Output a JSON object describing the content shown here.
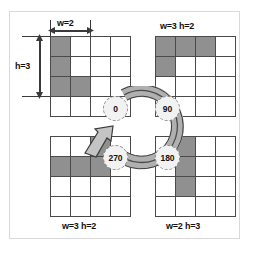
{
  "diagram": {
    "type": "rotation-diagram",
    "grid_size": {
      "rows": 4,
      "cols": 4
    },
    "colors": {
      "shaded_cell": "#909090",
      "empty_cell": "#ffffff",
      "grid_line": "#4a4a4a",
      "ring_fill": "#b0b0b0",
      "ring_stroke": "#3a3a3a",
      "badge_fill": "#f2f2f2",
      "badge_stroke": "#8d8d8d",
      "frame": "#d9d9d9",
      "background": "#ffffff"
    },
    "quadrants": [
      {
        "id": "top-left",
        "angle_label": "0",
        "label": "",
        "label_position": "none",
        "width_label": "w=2",
        "height_label": "h=3",
        "shaded_cells": [
          [
            0,
            0
          ],
          [
            1,
            0
          ],
          [
            2,
            0
          ],
          [
            2,
            1
          ]
        ]
      },
      {
        "id": "top-right",
        "angle_label": "90",
        "label": "w=3 h=2",
        "label_position": "above",
        "shaded_cells": [
          [
            0,
            0
          ],
          [
            0,
            1
          ],
          [
            0,
            2
          ],
          [
            1,
            0
          ]
        ]
      },
      {
        "id": "bottom-left",
        "angle_label": "270",
        "label": "w=3 h=2",
        "label_position": "below",
        "shaded_cells": [
          [
            0,
            2
          ],
          [
            1,
            0
          ],
          [
            1,
            1
          ],
          [
            1,
            2
          ]
        ]
      },
      {
        "id": "bottom-right",
        "angle_label": "180",
        "label": "w=2 h=3",
        "label_position": "below",
        "shaded_cells": [
          [
            0,
            1
          ],
          [
            1,
            1
          ],
          [
            2,
            1
          ]
        ]
      }
    ],
    "dimensions": [
      {
        "name": "width",
        "text": "w=2",
        "span_cells": 2,
        "orientation": "horizontal"
      },
      {
        "name": "height",
        "text": "h=3",
        "span_cells": 3,
        "orientation": "vertical"
      }
    ],
    "rotation": {
      "direction": "clockwise",
      "arrow_points_to": "270",
      "badges": [
        {
          "angle": "0",
          "position": "top-left"
        },
        {
          "angle": "90",
          "position": "top-right"
        },
        {
          "angle": "180",
          "position": "bottom-right"
        },
        {
          "angle": "270",
          "position": "bottom-left"
        }
      ]
    }
  }
}
